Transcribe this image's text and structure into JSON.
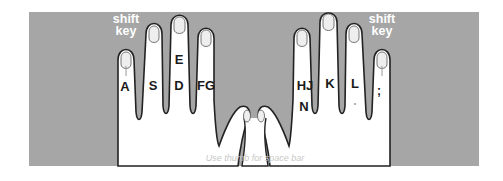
{
  "diagram": {
    "colors": {
      "panel": "#a6a6a6",
      "hand": "#ffffff",
      "outline": "#222222",
      "shift_text": "#ffffff",
      "caption_text": "#c8c8c8"
    },
    "left_hand": {
      "shift_label_line1": "shift",
      "shift_label_line2": "key",
      "fingers": [
        {
          "name": "pinky",
          "keys": "A"
        },
        {
          "name": "ring",
          "keys": "S"
        },
        {
          "name": "middle",
          "keys_top": "E",
          "keys": "D"
        },
        {
          "name": "index",
          "keys": "FG"
        }
      ]
    },
    "right_hand": {
      "shift_label_line1": "shift",
      "shift_label_line2": "key",
      "fingers": [
        {
          "name": "index",
          "keys": "HJ",
          "keys_bottom": "N"
        },
        {
          "name": "middle",
          "keys": "K"
        },
        {
          "name": "ring",
          "keys": "L"
        },
        {
          "name": "pinky",
          "keys": ";"
        }
      ]
    },
    "caption": "Use thumb for space bar"
  }
}
